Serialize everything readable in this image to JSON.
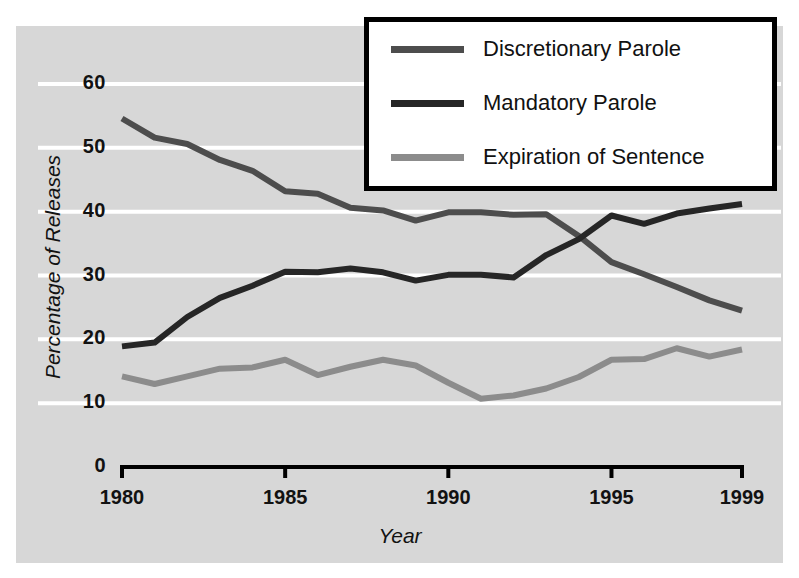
{
  "chart_data": {
    "type": "line",
    "title": "",
    "xlabel": "Year",
    "ylabel": "Percentage of Releases",
    "xlim": [
      1980,
      1999
    ],
    "ylim": [
      0,
      60
    ],
    "ytick_labels": [
      "60",
      "50",
      "40",
      "30",
      "20",
      "10",
      "0"
    ],
    "yticks": [
      60,
      50,
      40,
      30,
      20,
      10,
      0
    ],
    "xtick_labels": [
      "1980",
      "1985",
      "1990",
      "1995",
      "1999"
    ],
    "xticks": [
      1980,
      1985,
      1990,
      1995,
      1999
    ],
    "grid": "horizontal-white-gridlines",
    "legend_position": "top-right",
    "x": [
      1980,
      1981,
      1982,
      1983,
      1984,
      1985,
      1986,
      1987,
      1988,
      1989,
      1990,
      1991,
      1992,
      1993,
      1994,
      1995,
      1996,
      1997,
      1998,
      1999
    ],
    "series": [
      {
        "name": "Discretionary Parole",
        "color": "#4d4d4d",
        "values": [
          54.6,
          51.6,
          50.6,
          48.1,
          46.4,
          43.2,
          42.8,
          40.6,
          40.2,
          38.6,
          39.9,
          39.9,
          39.5,
          39.6,
          36.2,
          32.1,
          30.2,
          28.2,
          26.1,
          24.5
        ]
      },
      {
        "name": "Mandatory Parole",
        "color": "#262626",
        "values": [
          18.9,
          19.5,
          23.5,
          26.5,
          28.4,
          30.6,
          30.5,
          31.1,
          30.5,
          29.2,
          30.1,
          30.1,
          29.7,
          33.2,
          35.7,
          39.4,
          38.1,
          39.7,
          40.5,
          41.2
        ]
      },
      {
        "name": "Expiration of Sentence",
        "color": "#8c8c8c",
        "values": [
          14.2,
          13.0,
          14.2,
          15.4,
          15.6,
          16.8,
          14.4,
          15.7,
          16.8,
          15.9,
          13.2,
          10.7,
          11.2,
          12.3,
          14.1,
          16.8,
          16.9,
          18.6,
          17.3,
          18.4
        ]
      }
    ]
  },
  "legend": {
    "items": [
      {
        "label": "Discretionary Parole",
        "color": "#4d4d4d"
      },
      {
        "label": "Mandatory Parole",
        "color": "#262626"
      },
      {
        "label": "Expiration of Sentence",
        "color": "#8c8c8c"
      }
    ]
  },
  "axes": {
    "y_title": "Percentage of Releases",
    "x_title": "Year"
  },
  "colors": {
    "panel_background": "#d7d7d7",
    "gridline": "#ffffff",
    "axis": "#000000",
    "text": "#121212"
  }
}
